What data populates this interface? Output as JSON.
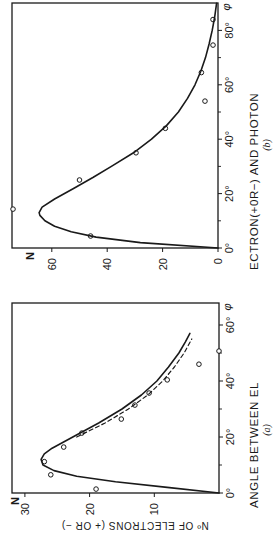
{
  "figure": {
    "shared_xlabel": "ANGLE BETWEEN ELECTRON (+OR−) AND PHOTON",
    "xlabel_part_a": "ANGLE   BETWEEN   EL",
    "xlabel_part_b": "ECTRON(+0R−) AND PHOTON",
    "rotation": "90deg counter-clockwise",
    "colors": {
      "ink": "#1a1a1a",
      "background": "#ffffff"
    }
  },
  "chart_data": [
    {
      "id": "a",
      "type": "scatter",
      "panel_label": "(a)",
      "title": "",
      "xlabel": "ANGLE BETWEEN ELECTRON (+OR−) AND PHOTON",
      "ylabel": "Nº OF ELECTRONS (+ OR −)",
      "ylabel_short": "N",
      "x_unit": "φ",
      "xlim": [
        0,
        68
      ],
      "ylim": [
        0,
        31
      ],
      "xticks": [
        0,
        20,
        40,
        60
      ],
      "xtick_labels": [
        "0°",
        "20°",
        "40°",
        "60°"
      ],
      "xminor_ticks": [
        10,
        30,
        50
      ],
      "yticks": [
        10,
        20,
        30
      ],
      "ytick_labels": [
        "10",
        "20",
        "30"
      ],
      "grid": false,
      "series": [
        {
          "name": "observed",
          "style": "open-circles",
          "x": [
            1.4,
            6.5,
            11.2,
            16.4,
            21.4,
            26.4,
            31.4,
            35.7,
            40.4,
            46.0,
            50.7
          ],
          "y": [
            19.0,
            26.0,
            27.0,
            24.0,
            21.2,
            15.1,
            13.0,
            10.8,
            8.0,
            3.1,
            0.0
          ]
        },
        {
          "name": "theory (solid)",
          "style": "solid-line",
          "x": [
            0,
            2,
            4,
            6,
            8,
            10,
            12,
            14,
            16,
            20,
            25,
            30,
            35,
            40,
            45,
            50,
            54,
            57
          ],
          "y": [
            0,
            8,
            16,
            22,
            25.5,
            27.2,
            27.5,
            27.0,
            25.8,
            22.6,
            18.6,
            15.0,
            12.0,
            9.6,
            7.8,
            6.2,
            5.2,
            4.5
          ]
        },
        {
          "name": "theory (dashed)",
          "style": "dashed-line",
          "x": [
            20,
            25,
            30,
            35,
            40,
            45,
            50,
            55
          ],
          "y": [
            22.0,
            17.6,
            14.0,
            11.0,
            8.7,
            6.9,
            5.4,
            4.2
          ]
        }
      ]
    },
    {
      "id": "b",
      "type": "scatter",
      "panel_label": "(b)",
      "title": "",
      "xlabel": "ANGLE BETWEEN ELECTRON (+OR−) AND PHOTON",
      "ylabel": "N",
      "x_unit": "φ",
      "xlim": [
        0,
        90
      ],
      "ylim": [
        0,
        74
      ],
      "xticks": [
        0,
        20,
        40,
        60,
        80
      ],
      "xtick_labels": [
        "0°",
        "20°",
        "40°",
        "60°",
        "80°"
      ],
      "xminor_ticks": [
        10,
        30,
        50,
        70
      ],
      "yticks": [
        0,
        20,
        40,
        60
      ],
      "ytick_labels": [
        "0",
        "20",
        "40",
        "60"
      ],
      "grid": false,
      "series": [
        {
          "name": "observed",
          "style": "open-circles",
          "x": [
            4.4,
            14.3,
            25.0,
            35.0,
            44.0,
            54.0,
            64.5,
            74.6,
            84.0
          ],
          "y": [
            46.0,
            74.0,
            50.0,
            29.6,
            19.0,
            4.7,
            6.0,
            1.8,
            1.8
          ]
        },
        {
          "name": "theory",
          "style": "solid-line",
          "x": [
            0,
            2,
            4,
            6,
            8,
            10,
            12,
            13,
            15,
            18,
            22,
            26,
            30,
            35,
            40,
            45,
            50,
            55,
            60,
            65,
            70,
            75,
            80,
            85,
            90
          ],
          "y": [
            0,
            28,
            44,
            53,
            59,
            62.5,
            64.3,
            64.6,
            63.5,
            59,
            52,
            45,
            38.5,
            30.5,
            24,
            18.6,
            14.3,
            11,
            8.3,
            6.2,
            4.5,
            3.2,
            2.1,
            1.2,
            0.5
          ]
        }
      ]
    }
  ]
}
